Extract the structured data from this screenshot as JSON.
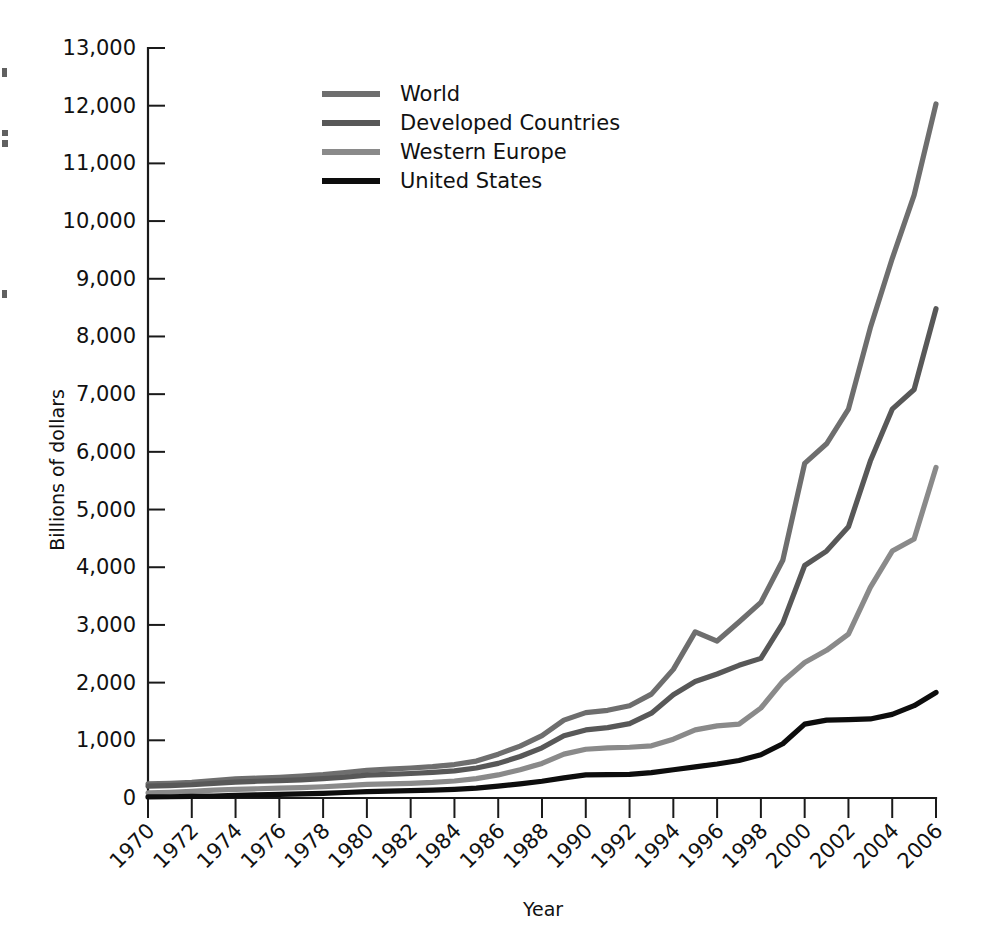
{
  "chart_data": {
    "type": "line",
    "title": "",
    "xlabel": "Year",
    "ylabel": "Billions of dollars",
    "xlim": [
      1970,
      2006
    ],
    "ylim": [
      0,
      13000
    ],
    "grid": false,
    "legend_position": "top-left-inside",
    "x_tick_labels": [
      "1970",
      "1972",
      "1974",
      "1976",
      "1978",
      "1980",
      "1982",
      "1984",
      "1986",
      "1988",
      "1990",
      "1992",
      "1994",
      "1996",
      "1998",
      "2000",
      "2002",
      "2004",
      "2006"
    ],
    "y_tick_labels": [
      "0",
      "1,000",
      "2,000",
      "3,000",
      "4,000",
      "5,000",
      "6,000",
      "7,000",
      "8,000",
      "9,000",
      "10,000",
      "11,000",
      "12,000",
      "13,000"
    ],
    "y_tick_values": [
      0,
      1000,
      2000,
      3000,
      4000,
      5000,
      6000,
      7000,
      8000,
      9000,
      10000,
      11000,
      12000,
      13000
    ],
    "x": [
      1970,
      1971,
      1972,
      1973,
      1974,
      1975,
      1976,
      1977,
      1978,
      1979,
      1980,
      1981,
      1982,
      1983,
      1984,
      1985,
      1986,
      1987,
      1988,
      1989,
      1990,
      1991,
      1992,
      1993,
      1994,
      1995,
      1996,
      1997,
      1998,
      1999,
      2000,
      2001,
      2002,
      2003,
      2004,
      2005,
      2006
    ],
    "series": [
      {
        "name": "World",
        "color": "#6e6e6e",
        "values": [
          245,
          255,
          270,
          300,
          330,
          345,
          360,
          380,
          405,
          440,
          480,
          500,
          520,
          545,
          580,
          640,
          760,
          900,
          1080,
          1350,
          1480,
          1520,
          1600,
          1800,
          2230,
          2880,
          2720,
          3050,
          3390,
          4120,
          5800,
          6140,
          6740,
          8150,
          9350,
          10450,
          12030
        ]
      },
      {
        "name": "Developed Countries",
        "color": "#585858",
        "values": [
          205,
          215,
          230,
          255,
          275,
          290,
          300,
          315,
          335,
          360,
          395,
          410,
          425,
          445,
          470,
          520,
          600,
          720,
          870,
          1080,
          1180,
          1220,
          1290,
          1470,
          1790,
          2020,
          2150,
          2300,
          2420,
          3030,
          4030,
          4280,
          4700,
          5840,
          6740,
          7080,
          8480
        ]
      },
      {
        "name": "Western Europe",
        "color": "#8a8a8a",
        "values": [
          90,
          100,
          115,
          135,
          150,
          160,
          170,
          180,
          195,
          215,
          235,
          245,
          255,
          270,
          295,
          335,
          400,
          490,
          600,
          760,
          845,
          870,
          880,
          905,
          1020,
          1180,
          1250,
          1280,
          1560,
          2020,
          2350,
          2560,
          2840,
          3650,
          4280,
          4490,
          5730
        ]
      },
      {
        "name": "United States",
        "color": "#0d0d0d",
        "values": [
          18,
          22,
          28,
          35,
          45,
          55,
          62,
          70,
          80,
          95,
          110,
          120,
          128,
          138,
          150,
          170,
          205,
          245,
          290,
          350,
          400,
          405,
          410,
          440,
          490,
          540,
          590,
          650,
          750,
          940,
          1280,
          1350,
          1360,
          1370,
          1450,
          1600,
          1830
        ]
      }
    ]
  },
  "legend": {
    "items": [
      {
        "label": "World"
      },
      {
        "label": "Developed Countries"
      },
      {
        "label": "Western Europe"
      },
      {
        "label": "United States"
      }
    ]
  }
}
